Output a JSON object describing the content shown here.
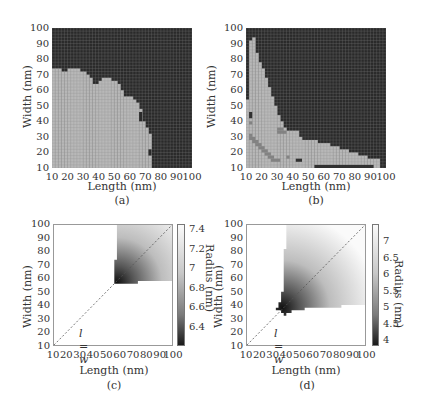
{
  "chart_data": [
    {
      "id": "a",
      "type": "heatmap",
      "caption": "(a)",
      "xlabel": "Length (nm)",
      "ylabel": "Width (nm)",
      "xlim": [
        10,
        100
      ],
      "ylim": [
        10,
        100
      ],
      "xticks": [
        "10",
        "20",
        "30",
        "40",
        "50",
        "60",
        "70",
        "80",
        "90",
        "100"
      ],
      "yticks": [
        "100",
        "90",
        "80",
        "70",
        "60",
        "50",
        "40",
        "30",
        "20",
        "10"
      ],
      "grid_step": 2,
      "colors": {
        "stable": "#b8b8b8",
        "unstable": "#2a2a2a",
        "grid_line": "#8a8a8a"
      },
      "description": "Light (stable) region in lower-left, dark elsewhere",
      "boundary_x": [
        10,
        12,
        14,
        16,
        18,
        20,
        22,
        24,
        26,
        28,
        30,
        32,
        34,
        36,
        38,
        40,
        42,
        44,
        46,
        48,
        50,
        52,
        54,
        56,
        58,
        60,
        62,
        64,
        66,
        68,
        70,
        72
      ],
      "boundary_top_width": [
        74,
        74,
        74,
        72,
        72,
        74,
        74,
        74,
        74,
        72,
        72,
        70,
        68,
        64,
        64,
        66,
        68,
        68,
        68,
        66,
        66,
        64,
        60,
        56,
        56,
        56,
        54,
        52,
        48,
        40,
        36,
        32
      ]
    },
    {
      "id": "b",
      "type": "heatmap",
      "caption": "(b)",
      "xlabel": "Length (nm)",
      "ylabel": "Width (nm)",
      "xlim": [
        10,
        100
      ],
      "ylim": [
        10,
        100
      ],
      "xticks": [
        "10",
        "20",
        "30",
        "40",
        "50",
        "60",
        "70",
        "80",
        "90",
        "100"
      ],
      "yticks": [
        "100",
        "90",
        "80",
        "70",
        "60",
        "50",
        "40",
        "30",
        "20",
        "10"
      ],
      "grid_step": 2,
      "colors": {
        "stable": "#b8b8b8",
        "unstable": "#2a2a2a",
        "intermediate": "#808080",
        "grid_line": "#8a8a8a"
      },
      "boundary_x": [
        10,
        12,
        14,
        16,
        18,
        20,
        22,
        24,
        26,
        28,
        30,
        32,
        34,
        36,
        38,
        40,
        42,
        44,
        46,
        48,
        50,
        52,
        54,
        56,
        58,
        60,
        62,
        64,
        66,
        68,
        70,
        72,
        74,
        76,
        78,
        80,
        82,
        84,
        86,
        88,
        90,
        92,
        94
      ],
      "boundary_top_width": [
        54,
        92,
        94,
        84,
        78,
        74,
        68,
        62,
        56,
        50,
        44,
        40,
        36,
        34,
        34,
        34,
        34,
        30,
        28,
        28,
        28,
        28,
        28,
        26,
        26,
        26,
        26,
        24,
        24,
        24,
        22,
        22,
        22,
        20,
        20,
        20,
        18,
        18,
        18,
        16,
        16,
        16,
        16
      ]
    },
    {
      "id": "c",
      "type": "heatmap",
      "caption": "(c)",
      "xlabel": "Length (nm)",
      "ylabel": "Width (nm)",
      "xlim": [
        10,
        100
      ],
      "ylim": [
        10,
        100
      ],
      "xticks": [
        "10",
        "20",
        "30",
        "40",
        "50",
        "60",
        "70",
        "80",
        "90",
        "100"
      ],
      "yticks": [
        "100",
        "90",
        "80",
        "70",
        "60",
        "50",
        "40",
        "30",
        "20",
        "10"
      ],
      "annotation": "l = w",
      "diagonal_line": true,
      "colorbar": {
        "label": "Radius (nm)",
        "ticks": [
          "7.4",
          "7.2",
          "7",
          "6.8",
          "6.6",
          "6.4"
        ],
        "range": [
          6.25,
          7.45
        ]
      },
      "region": "Gradient region starting near l=56-58, w=56-58, extending to 100; darkest near (58,57)"
    },
    {
      "id": "d",
      "type": "heatmap",
      "caption": "(d)",
      "xlabel": "Length (nm)",
      "ylabel": "Width (nm)",
      "xlim": [
        10,
        100
      ],
      "ylim": [
        10,
        100
      ],
      "xticks": [
        "10",
        "20",
        "30",
        "40",
        "50",
        "60",
        "70",
        "80",
        "90",
        "100"
      ],
      "yticks": [
        "100",
        "90",
        "80",
        "70",
        "60",
        "50",
        "40",
        "30",
        "20",
        "10"
      ],
      "annotation": "l = w",
      "diagonal_line": true,
      "colorbar": {
        "label": "Radius (nm)",
        "ticks": [
          "7",
          "6.5",
          "6",
          "5.5",
          "5",
          "4.5",
          "4"
        ],
        "range": [
          3.7,
          7.5
        ]
      },
      "region": "Gradient region starting near l=34-40, w=34-40, extending to 100; darkest near (37,37)"
    }
  ]
}
